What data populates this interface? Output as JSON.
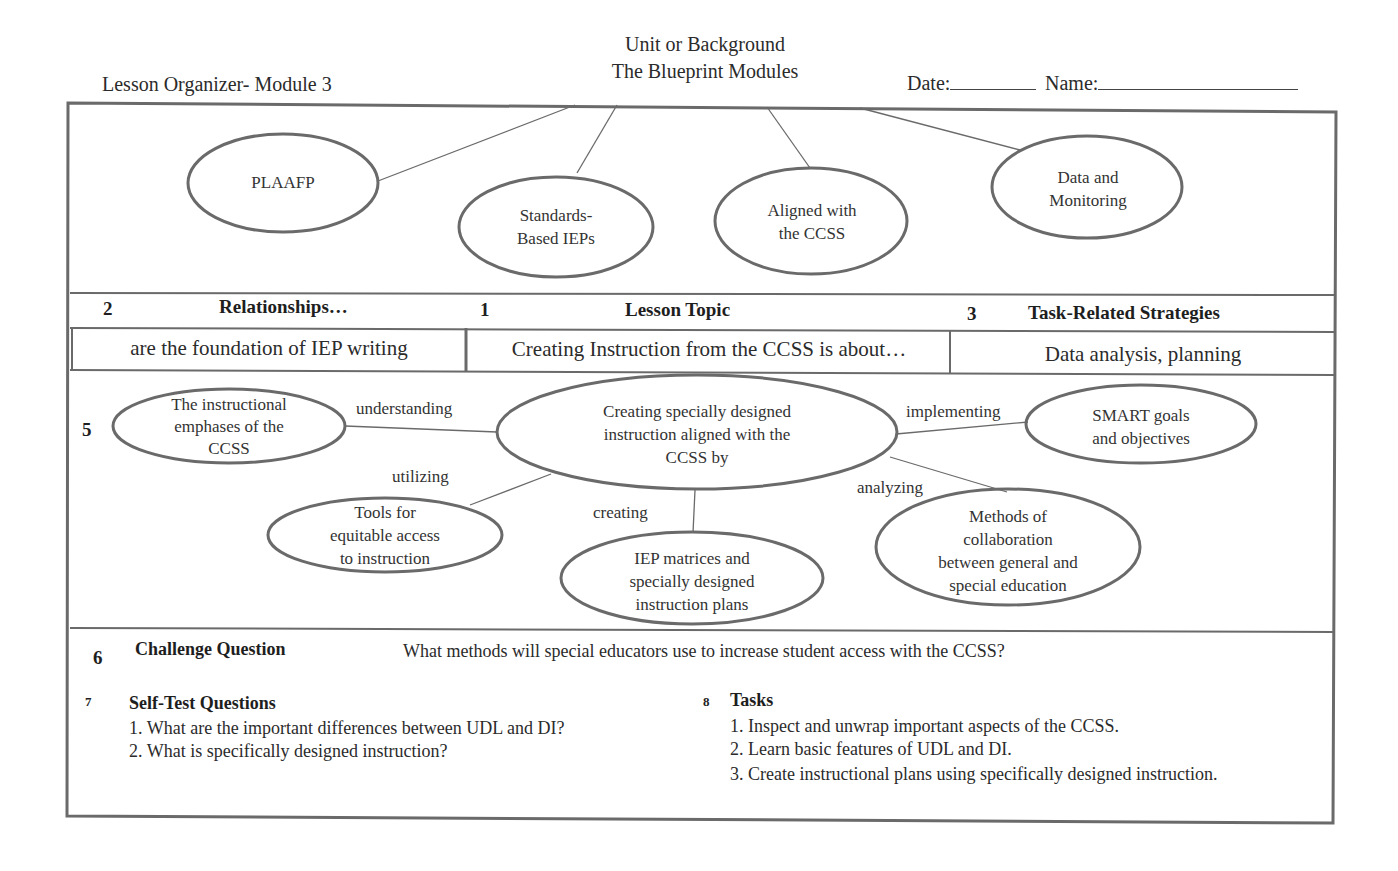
{
  "header": {
    "left_title": "Lesson Organizer- Module 3",
    "center_line1": "Unit or Background",
    "center_line2": "The Blueprint Modules",
    "date_label": "Date:",
    "date_value": "",
    "name_label": "Name:",
    "name_value": ""
  },
  "unit_map": {
    "nodes": [
      {
        "id": "plaafp",
        "lines": [
          "PLAAFP"
        ]
      },
      {
        "id": "standards-based-ieps",
        "lines": [
          "Standards-",
          "Based IEPs"
        ]
      },
      {
        "id": "aligned-ccss",
        "lines": [
          "Aligned with",
          "the CCSS"
        ]
      },
      {
        "id": "data-monitoring",
        "lines": [
          "Data and",
          "Monitoring"
        ]
      }
    ]
  },
  "sections": {
    "relationships": {
      "number": "2",
      "title": "Relationships…",
      "value": "are the foundation of IEP writing"
    },
    "lesson_topic": {
      "number": "1",
      "title": "Lesson Topic",
      "value": "Creating Instruction from the  CCSS is about…"
    },
    "task_strategies": {
      "number": "3",
      "title": "Task-Related Strategies",
      "value": "Data analysis, planning"
    }
  },
  "concept_map": {
    "number": "5",
    "center": {
      "lines": [
        "Creating specially designed",
        "instruction aligned with the",
        "CCSS by"
      ]
    },
    "nodes": [
      {
        "id": "instructional-emphases",
        "lines": [
          "The instructional",
          "emphases of the",
          "CCSS"
        ],
        "link_label": "understanding"
      },
      {
        "id": "tools-equitable-access",
        "lines": [
          "Tools for",
          "equitable access",
          "to instruction"
        ],
        "link_label": "utilizing"
      },
      {
        "id": "iep-matrices",
        "lines": [
          "IEP matrices and",
          "specially designed",
          "instruction plans"
        ],
        "link_label": "creating"
      },
      {
        "id": "methods-collaboration",
        "lines": [
          "Methods of",
          "collaboration",
          "between general and",
          "special education"
        ],
        "link_label": "analyzing"
      },
      {
        "id": "smart-goals",
        "lines": [
          "SMART goals",
          "and objectives"
        ],
        "link_label": "implementing"
      }
    ]
  },
  "challenge": {
    "number": "6",
    "title": "Challenge Question",
    "question": "What methods will special educators use to increase student access with the CCSS?"
  },
  "self_test": {
    "number": "7",
    "title": "Self-Test Questions",
    "items": [
      "1. What are the important differences between UDL and DI?",
      "2. What is specifically designed instruction?"
    ]
  },
  "tasks": {
    "number": "8",
    "title": "Tasks",
    "items": [
      "1. Inspect and unwrap important aspects of the CCSS.",
      "2. Learn basic features of UDL and DI.",
      "3. Create instructional plans using specifically designed instruction."
    ]
  }
}
